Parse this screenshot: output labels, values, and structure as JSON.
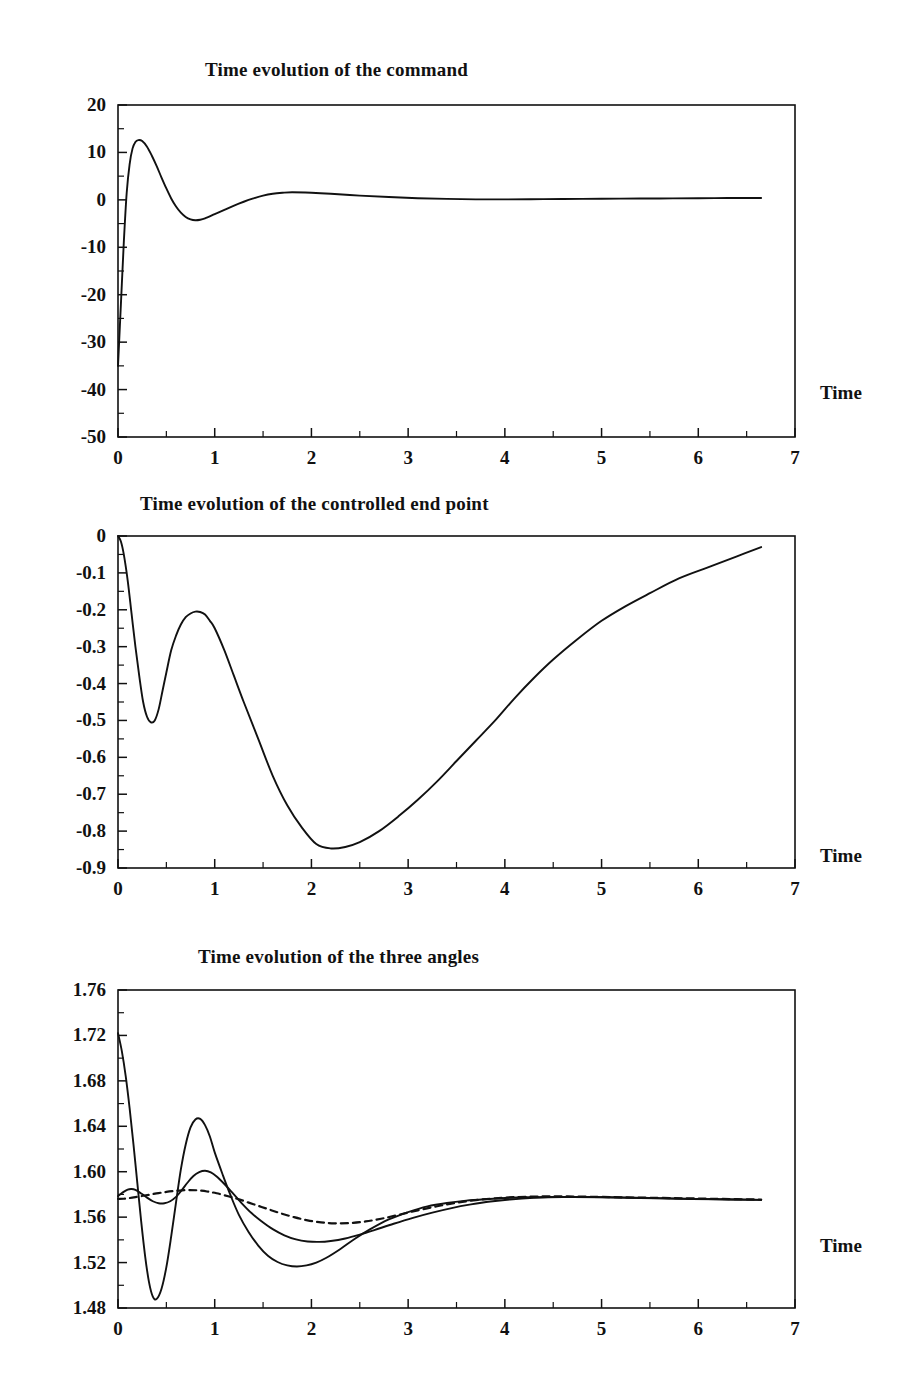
{
  "figure": {
    "background": "#ffffff",
    "ink_color": "#111111",
    "panel_count": 3
  },
  "panels": [
    {
      "title": "Time evolution of the command",
      "xaxis_name": "Time",
      "ytick_labels": [
        "20",
        "10",
        "0",
        "-10",
        "-20",
        "-30",
        "-40",
        "-50"
      ],
      "xtick_labels": [
        "0",
        "1",
        "2",
        "3",
        "4",
        "5",
        "6",
        "7"
      ]
    },
    {
      "title": "Time evolution of the controlled end point",
      "xaxis_name": "Time",
      "ytick_labels": [
        "0",
        "-0.1",
        "-0.2",
        "-0.3",
        "-0.4",
        "-0.5",
        "-0.6",
        "-0.7",
        "-0.8",
        "-0.9"
      ],
      "xtick_labels": [
        "0",
        "1",
        "2",
        "3",
        "4",
        "5",
        "6",
        "7"
      ]
    },
    {
      "title": "Time evolution of the three angles",
      "xaxis_name": "Time",
      "ytick_labels": [
        "1.76",
        "1.72",
        "1.68",
        "1.64",
        "1.60",
        "1.56",
        "1.52",
        "1.48"
      ],
      "xtick_labels": [
        "0",
        "1",
        "2",
        "3",
        "4",
        "5",
        "6",
        "7"
      ]
    }
  ],
  "chart_data": [
    {
      "type": "line",
      "title": "Time evolution of the command",
      "xlabel": "Time",
      "ylabel": "",
      "xlim": [
        0,
        7
      ],
      "ylim": [
        -50,
        20
      ],
      "xticks": [
        0,
        1,
        2,
        3,
        4,
        5,
        6,
        7
      ],
      "yticks": [
        -50,
        -40,
        -30,
        -20,
        -10,
        0,
        10,
        20
      ],
      "minor_ytick_step": 5,
      "minor_xtick_step": 0.5,
      "grid": false,
      "legend": "none",
      "series": [
        {
          "name": "command",
          "style": "solid",
          "x": [
            0.0,
            0.03,
            0.06,
            0.09,
            0.12,
            0.15,
            0.18,
            0.21,
            0.25,
            0.3,
            0.35,
            0.4,
            0.45,
            0.5,
            0.55,
            0.6,
            0.65,
            0.7,
            0.75,
            0.8,
            0.85,
            0.9,
            1.0,
            1.1,
            1.2,
            1.3,
            1.4,
            1.5,
            1.6,
            1.7,
            1.8,
            2.0,
            2.2,
            2.5,
            2.8,
            3.1,
            3.4,
            3.7,
            4.0,
            4.4,
            4.8,
            5.2,
            5.6,
            6.0,
            6.3,
            6.65
          ],
          "y": [
            -35.0,
            -22.0,
            -9.0,
            1.5,
            7.5,
            10.8,
            12.2,
            12.6,
            12.4,
            11.2,
            9.3,
            7.1,
            4.7,
            2.4,
            0.3,
            -1.4,
            -2.7,
            -3.6,
            -4.1,
            -4.3,
            -4.2,
            -3.9,
            -3.0,
            -2.1,
            -1.2,
            -0.4,
            0.3,
            0.9,
            1.3,
            1.5,
            1.6,
            1.5,
            1.3,
            0.9,
            0.6,
            0.35,
            0.2,
            0.1,
            0.1,
            0.15,
            0.2,
            0.25,
            0.3,
            0.35,
            0.38,
            0.4
          ]
        }
      ]
    },
    {
      "type": "line",
      "title": "Time evolution of the controlled end point",
      "xlabel": "Time",
      "ylabel": "",
      "xlim": [
        0,
        7
      ],
      "ylim": [
        -0.9,
        0.0
      ],
      "xticks": [
        0,
        1,
        2,
        3,
        4,
        5,
        6,
        7
      ],
      "yticks": [
        -0.9,
        -0.8,
        -0.7,
        -0.6,
        -0.5,
        -0.4,
        -0.3,
        -0.2,
        -0.1,
        0.0
      ],
      "minor_ytick_step": 0.05,
      "minor_xtick_step": 0.5,
      "grid": false,
      "legend": "none",
      "series": [
        {
          "name": "controlled end point",
          "style": "solid",
          "x": [
            0.0,
            0.03,
            0.06,
            0.1,
            0.14,
            0.18,
            0.22,
            0.26,
            0.3,
            0.34,
            0.38,
            0.42,
            0.46,
            0.5,
            0.55,
            0.6,
            0.65,
            0.7,
            0.75,
            0.8,
            0.85,
            0.9,
            0.95,
            1.0,
            1.1,
            1.2,
            1.3,
            1.45,
            1.6,
            1.75,
            1.9,
            2.05,
            2.2,
            2.35,
            2.5,
            2.7,
            2.9,
            3.1,
            3.3,
            3.5,
            3.7,
            3.9,
            4.1,
            4.3,
            4.5,
            4.75,
            5.0,
            5.25,
            5.5,
            5.8,
            6.1,
            6.4,
            6.65
          ],
          "y": [
            0.0,
            -0.015,
            -0.05,
            -0.12,
            -0.21,
            -0.3,
            -0.38,
            -0.45,
            -0.49,
            -0.505,
            -0.5,
            -0.47,
            -0.42,
            -0.37,
            -0.31,
            -0.27,
            -0.24,
            -0.22,
            -0.21,
            -0.205,
            -0.206,
            -0.213,
            -0.23,
            -0.25,
            -0.31,
            -0.38,
            -0.45,
            -0.55,
            -0.65,
            -0.73,
            -0.79,
            -0.835,
            -0.847,
            -0.843,
            -0.83,
            -0.8,
            -0.76,
            -0.715,
            -0.665,
            -0.61,
            -0.555,
            -0.5,
            -0.44,
            -0.385,
            -0.335,
            -0.28,
            -0.23,
            -0.19,
            -0.155,
            -0.115,
            -0.085,
            -0.055,
            -0.03
          ]
        }
      ]
    },
    {
      "type": "line",
      "title": "Time evolution of the three angles",
      "xlabel": "Time",
      "ylabel": "",
      "xlim": [
        0,
        7
      ],
      "ylim": [
        1.48,
        1.76
      ],
      "xticks": [
        0,
        1,
        2,
        3,
        4,
        5,
        6,
        7
      ],
      "yticks": [
        1.48,
        1.52,
        1.56,
        1.6,
        1.64,
        1.68,
        1.72,
        1.76
      ],
      "minor_ytick_step": 0.02,
      "minor_xtick_step": 0.5,
      "grid": false,
      "legend": "none",
      "series": [
        {
          "name": "angle 1",
          "style": "solid",
          "x": [
            0.0,
            0.04,
            0.08,
            0.12,
            0.16,
            0.2,
            0.24,
            0.28,
            0.32,
            0.36,
            0.4,
            0.45,
            0.5,
            0.55,
            0.6,
            0.65,
            0.7,
            0.75,
            0.8,
            0.85,
            0.9,
            0.95,
            1.0,
            1.08,
            1.16,
            1.25,
            1.35,
            1.45,
            1.55,
            1.65,
            1.75,
            1.85,
            1.95,
            2.05,
            2.15,
            2.3,
            2.45,
            2.6,
            2.8,
            3.0,
            3.2,
            3.4,
            3.6,
            3.8,
            4.0,
            4.2,
            4.45,
            4.7,
            5.0,
            5.4,
            5.8,
            6.2,
            6.65
          ],
          "y": [
            1.722,
            1.706,
            1.684,
            1.656,
            1.624,
            1.59,
            1.556,
            1.526,
            1.503,
            1.49,
            1.488,
            1.497,
            1.516,
            1.543,
            1.573,
            1.602,
            1.624,
            1.639,
            1.646,
            1.6465,
            1.641,
            1.631,
            1.617,
            1.598,
            1.58,
            1.562,
            1.547,
            1.535,
            1.526,
            1.5205,
            1.5175,
            1.5165,
            1.5175,
            1.52,
            1.524,
            1.532,
            1.541,
            1.549,
            1.558,
            1.5645,
            1.5695,
            1.5725,
            1.5745,
            1.5758,
            1.5768,
            1.5775,
            1.5778,
            1.5778,
            1.5775,
            1.5768,
            1.5762,
            1.5757,
            1.5752
          ]
        },
        {
          "name": "angle 2",
          "style": "solid",
          "x": [
            0.0,
            0.05,
            0.1,
            0.14,
            0.18,
            0.24,
            0.3,
            0.36,
            0.42,
            0.48,
            0.54,
            0.6,
            0.66,
            0.72,
            0.78,
            0.84,
            0.9,
            0.96,
            1.02,
            1.1,
            1.18,
            1.28,
            1.38,
            1.48,
            1.6,
            1.72,
            1.84,
            1.96,
            2.08,
            2.2,
            2.35,
            2.5,
            2.65,
            2.85,
            3.05,
            3.25,
            3.45,
            3.65,
            3.85,
            4.05,
            4.3,
            4.6,
            4.9,
            5.3,
            5.7,
            6.1,
            6.65
          ],
          "y": [
            1.5785,
            1.5818,
            1.5843,
            1.5848,
            1.584,
            1.5808,
            1.5772,
            1.574,
            1.5722,
            1.5722,
            1.574,
            1.5778,
            1.5838,
            1.5905,
            1.5962,
            1.5996,
            1.6008,
            1.5994,
            1.5958,
            1.5892,
            1.5818,
            1.5722,
            1.5636,
            1.5566,
            1.5494,
            1.544,
            1.5404,
            1.5386,
            1.5382,
            1.539,
            1.5412,
            1.5446,
            1.5486,
            1.5542,
            1.5594,
            1.564,
            1.568,
            1.5712,
            1.5738,
            1.5756,
            1.577,
            1.5778,
            1.5778,
            1.5772,
            1.5765,
            1.5759,
            1.5752
          ]
        },
        {
          "name": "angle 3",
          "style": "dashed",
          "x": [
            0.0,
            0.06,
            0.12,
            0.18,
            0.26,
            0.34,
            0.42,
            0.5,
            0.58,
            0.66,
            0.74,
            0.82,
            0.92,
            1.02,
            1.14,
            1.26,
            1.4,
            1.54,
            1.68,
            1.82,
            1.96,
            2.1,
            2.24,
            2.4,
            2.56,
            2.72,
            2.9,
            3.1,
            3.3,
            3.5,
            3.7,
            3.9,
            4.1,
            4.35,
            4.65,
            5.0,
            5.4,
            5.85,
            6.25,
            6.65
          ],
          "y": [
            1.576,
            1.5762,
            1.5768,
            1.5776,
            1.5788,
            1.58,
            1.5812,
            1.5822,
            1.583,
            1.5836,
            1.5838,
            1.5836,
            1.5826,
            1.581,
            1.5784,
            1.5754,
            1.5714,
            1.5674,
            1.5634,
            1.56,
            1.5572,
            1.5554,
            1.5546,
            1.5548,
            1.5562,
            1.5586,
            1.562,
            1.566,
            1.5696,
            1.5726,
            1.575,
            1.5766,
            1.5776,
            1.5782,
            1.5782,
            1.5778,
            1.5772,
            1.5766,
            1.576,
            1.5755
          ]
        }
      ]
    }
  ]
}
